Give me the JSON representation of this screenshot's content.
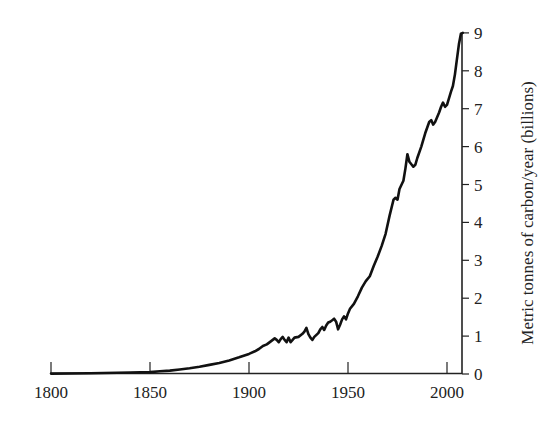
{
  "chart_data": {
    "type": "line",
    "title": "",
    "xlabel": "",
    "ylabel": "Metric tonnes of carbon/year (billions)",
    "xlim": [
      1800,
      2008
    ],
    "ylim": [
      0,
      9
    ],
    "x_ticks": [
      1800,
      1850,
      1900,
      1950,
      2000
    ],
    "y_ticks": [
      0,
      1,
      2,
      3,
      4,
      5,
      6,
      7,
      8,
      9
    ],
    "y_axis_position": "right",
    "grid": false,
    "legend": null,
    "series": [
      {
        "name": "Carbon emissions",
        "x": [
          1800,
          1820,
          1840,
          1850,
          1855,
          1860,
          1865,
          1870,
          1875,
          1880,
          1885,
          1890,
          1895,
          1900,
          1903,
          1905,
          1907,
          1909,
          1910,
          1911,
          1913,
          1914,
          1915,
          1916,
          1917,
          1918,
          1919,
          1920,
          1921,
          1922,
          1923,
          1925,
          1927,
          1928,
          1929,
          1930,
          1931,
          1932,
          1933,
          1935,
          1936,
          1937,
          1938,
          1939,
          1940,
          1941,
          1942,
          1943,
          1944,
          1945,
          1946,
          1947,
          1948,
          1949,
          1950,
          1951,
          1953,
          1955,
          1957,
          1959,
          1961,
          1963,
          1965,
          1967,
          1969,
          1971,
          1973,
          1974,
          1975,
          1976,
          1978,
          1979,
          1980,
          1981,
          1983,
          1984,
          1985,
          1987,
          1989,
          1991,
          1992,
          1993,
          1994,
          1996,
          1997,
          1998,
          1999,
          2000,
          2002,
          2003,
          2004,
          2005,
          2006,
          2007,
          2008
        ],
        "values": [
          0.01,
          0.02,
          0.04,
          0.05,
          0.07,
          0.09,
          0.12,
          0.15,
          0.19,
          0.24,
          0.29,
          0.36,
          0.44,
          0.53,
          0.6,
          0.66,
          0.74,
          0.78,
          0.82,
          0.86,
          0.94,
          0.9,
          0.84,
          0.92,
          0.98,
          0.9,
          0.84,
          0.96,
          0.84,
          0.9,
          0.96,
          0.98,
          1.06,
          1.12,
          1.22,
          1.05,
          0.96,
          0.9,
          0.98,
          1.08,
          1.18,
          1.24,
          1.16,
          1.28,
          1.36,
          1.38,
          1.42,
          1.46,
          1.38,
          1.18,
          1.3,
          1.44,
          1.52,
          1.44,
          1.6,
          1.72,
          1.85,
          2.05,
          2.28,
          2.45,
          2.58,
          2.85,
          3.1,
          3.38,
          3.7,
          4.18,
          4.6,
          4.65,
          4.6,
          4.88,
          5.1,
          5.42,
          5.8,
          5.6,
          5.47,
          5.52,
          5.7,
          6.0,
          6.35,
          6.65,
          6.7,
          6.58,
          6.65,
          6.9,
          7.05,
          7.16,
          7.05,
          7.1,
          7.45,
          7.6,
          7.9,
          8.3,
          8.7,
          8.98,
          9.0
        ]
      }
    ]
  }
}
